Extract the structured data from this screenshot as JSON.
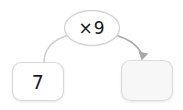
{
  "diagram": {
    "type": "function-machine",
    "background_color": "#ffffff",
    "input": {
      "value": "7",
      "shape": "rounded-rectangle",
      "fill_color": "#ffffff",
      "border_color": "#d9d9d9"
    },
    "operation": {
      "value": "×9",
      "shape": "ellipse",
      "fill_color": "#ffffff",
      "border_color": "#d4d4d4"
    },
    "output": {
      "value": "",
      "shape": "rounded-rectangle",
      "fill_color": "#f7f7f7",
      "border_color": "#dcdcdc"
    },
    "connectors": [
      {
        "name": "input-to-operation",
        "from": "input",
        "to": "operation",
        "arrowhead": false,
        "color": "#cfcfcf"
      },
      {
        "name": "operation-to-output",
        "from": "operation",
        "to": "output",
        "arrowhead": true,
        "color": "#a9a9a9"
      }
    ]
  }
}
